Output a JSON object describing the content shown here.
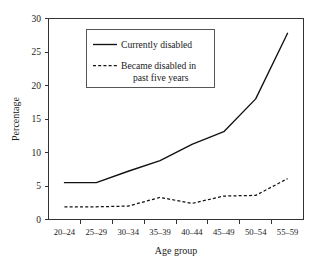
{
  "chart_data": {
    "type": "line",
    "title": "",
    "xlabel": "Age group",
    "ylabel": "Percentage",
    "categories": [
      "20–24",
      "25–29",
      "30–34",
      "35–39",
      "40–44",
      "45–49",
      "50–54",
      "55–59"
    ],
    "ylim": [
      0,
      30
    ],
    "yticks": [
      0,
      5,
      10,
      15,
      20,
      25,
      30
    ],
    "ytick_labels": [
      "0",
      "5",
      "10",
      "15",
      "20",
      "25",
      "30"
    ],
    "grid": false,
    "legend_position": "upper-left-inside",
    "series": [
      {
        "name": "Currently disabled",
        "style": "solid",
        "values": [
          5.5,
          5.5,
          7.2,
          8.8,
          11.2,
          13.1,
          18.0,
          27.8
        ]
      },
      {
        "name": "Became disabled in past five years",
        "style": "dashed",
        "values": [
          1.9,
          1.9,
          2.0,
          3.3,
          2.4,
          3.5,
          3.6,
          6.1
        ]
      }
    ]
  },
  "legend": {
    "entries": [
      {
        "label": "Currently disabled",
        "line2": ""
      },
      {
        "label": "Became disabled in",
        "line2": "past five years"
      }
    ]
  },
  "axes": {
    "y_title": "Percentage",
    "x_title": "Age group"
  },
  "colors": {
    "series_line": "#111111",
    "axis": "#333333",
    "background": "#ffffff",
    "legend_border": "#555555"
  }
}
